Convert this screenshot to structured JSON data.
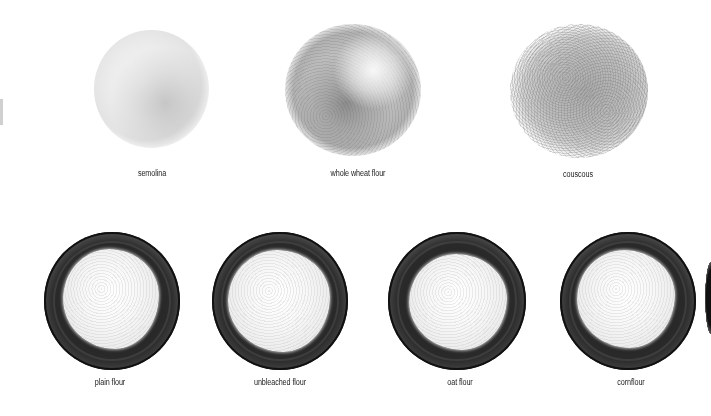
{
  "top_row": [
    {
      "label": "semolina",
      "kind": "loose pile"
    },
    {
      "label": "whole wheat flour",
      "kind": "loose pile"
    },
    {
      "label": "couscous",
      "kind": "loose pile"
    }
  ],
  "bottom_row": [
    {
      "label": "plain flour",
      "kind": "bowl"
    },
    {
      "label": "unbleached flour",
      "kind": "bowl"
    },
    {
      "label": "oat flour",
      "kind": "bowl"
    },
    {
      "label": "cornflour",
      "kind": "bowl"
    }
  ],
  "colors": {
    "background": "#ffffff",
    "bowl": "#1e1e1e",
    "flour": "#f7f7f7",
    "label_text": "#222222"
  }
}
